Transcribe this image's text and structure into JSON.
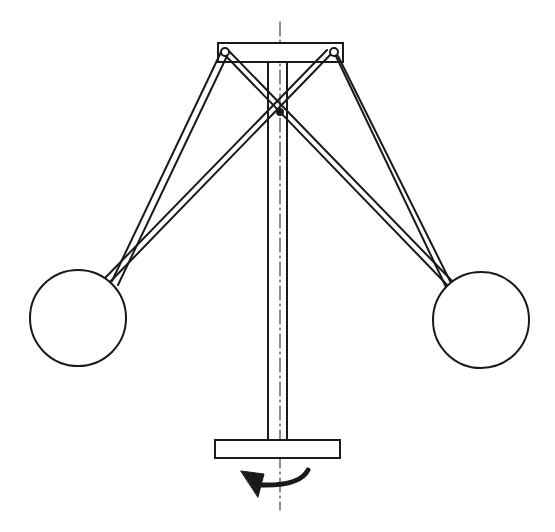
{
  "diagram": {
    "title": "Centrifugal governor (flyball) schematic",
    "colors": {
      "stroke": "#1a1a1a",
      "background": "#ffffff"
    },
    "components": [
      {
        "id": "top-crossbar",
        "label": "Top crossbar"
      },
      {
        "id": "vertical-shaft",
        "label": "Vertical shaft"
      },
      {
        "id": "axis",
        "label": "Axis of rotation"
      },
      {
        "id": "left-arm",
        "label": "Left arm"
      },
      {
        "id": "right-arm",
        "label": "Right arm"
      },
      {
        "id": "left-ball",
        "label": "Left flyball"
      },
      {
        "id": "right-ball",
        "label": "Right flyball"
      },
      {
        "id": "base-plate",
        "label": "Base plate"
      },
      {
        "id": "rotation-arrow",
        "label": "Rotation direction"
      }
    ]
  }
}
